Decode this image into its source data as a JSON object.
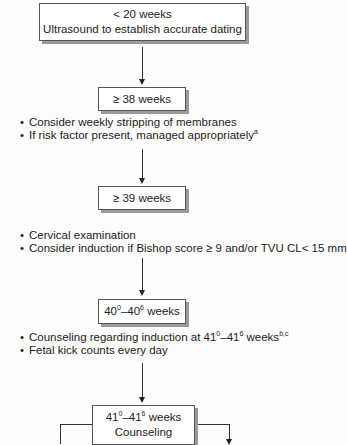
{
  "nodes": [
    {
      "id": "n1",
      "lines": [
        "< 20 weeks",
        "Ultrasound to establish accurate dating"
      ]
    },
    {
      "id": "n2",
      "lines": [
        "≥ 38 weeks"
      ]
    },
    {
      "id": "n3",
      "lines": [
        "≥ 39 weeks"
      ]
    },
    {
      "id": "n4",
      "base1": "40",
      "sup1": "0",
      "dash": "–",
      "base2": "40",
      "sup2": "6",
      "rest": " weeks"
    },
    {
      "id": "n5",
      "base1": "41",
      "sup1": "0",
      "dash": "–",
      "base2": "41",
      "sup2": "6",
      "rest": " weeks",
      "line2": "Counseling"
    }
  ],
  "notes": {
    "after_38": [
      {
        "text": "Consider weekly stripping of membranes"
      },
      {
        "text": "If risk factor present, managed appropriately",
        "sup": "a"
      }
    ],
    "after_39": [
      {
        "text": "Cervical examination"
      },
      {
        "text": "Consider induction if Bishop score ≥ 9 and/or TVU CL< 15 mm"
      }
    ],
    "after_40": [
      {
        "pre": "Counseling regarding induction at 41",
        "sup1": "0",
        "mid": "–41",
        "sup2": "6",
        "post": " weeks",
        "sup3": "b,c"
      },
      {
        "text": "Fetal kick counts every day"
      }
    ]
  }
}
